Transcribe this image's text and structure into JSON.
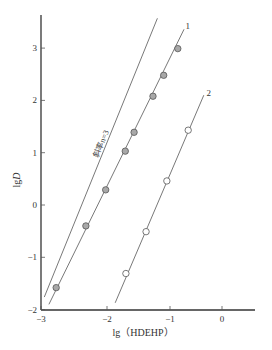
{
  "chart_data": {
    "type": "scatter",
    "title": "",
    "xlabel": "lg（HDEHP）",
    "ylabel": "lgD",
    "xlim": [
      -3,
      0.5
    ],
    "ylim": [
      -2,
      3.6
    ],
    "x_ticks": [
      -3,
      -2,
      -1,
      0
    ],
    "y_ticks": [
      -2,
      -1,
      0,
      1,
      2,
      3
    ],
    "x_tick_labels": [
      "−3",
      "−2",
      "−1",
      "0"
    ],
    "y_tick_labels": [
      "−2",
      "−1",
      "0",
      "1",
      "2",
      "3"
    ],
    "grid": false,
    "legend": "none (inline line labels)",
    "series": [
      {
        "name": "1",
        "marker": "filled-circle",
        "x": [
          -2.77,
          -2.32,
          -2.02,
          -1.71,
          -1.57,
          -1.27,
          -1.1,
          -0.85
        ],
        "y": [
          -1.58,
          -0.4,
          0.29,
          1.03,
          1.39,
          2.08,
          2.48,
          2.99
        ],
        "fit_line": {
          "x": [
            -2.88,
            -0.73
          ],
          "y": [
            -1.9,
            3.36
          ]
        }
      },
      {
        "name": "2",
        "marker": "open-circle",
        "x": [
          -1.7,
          -1.38,
          -1.05,
          -0.65
        ],
        "y": [
          -1.31,
          -0.51,
          0.46,
          1.43
        ],
        "fit_line": {
          "x": [
            -1.87,
            -0.35
          ],
          "y": [
            -1.87,
            2.1
          ]
        }
      }
    ],
    "reference_line": {
      "label": "斜率n=3",
      "x": [
        -2.95,
        -1.2
      ],
      "y": [
        -1.76,
        3.57
      ]
    },
    "annotations": [
      {
        "text": "1",
        "x": -0.7,
        "y": 3.36
      },
      {
        "text": "2",
        "x": -0.3,
        "y": 2.08
      },
      {
        "text": "斜率n=3",
        "x": -2.05,
        "y": 1.15,
        "rotation": -68
      }
    ]
  }
}
